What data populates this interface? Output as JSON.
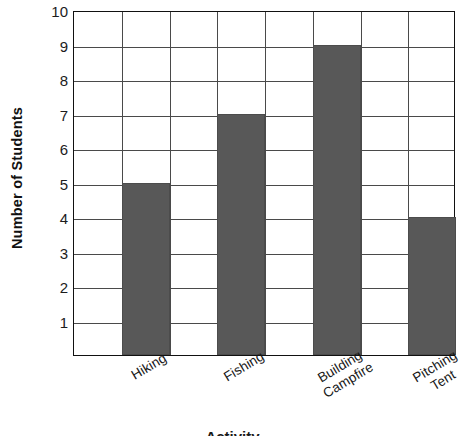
{
  "chart_data": {
    "type": "bar",
    "title": "",
    "xlabel": "Activity",
    "ylabel": "Number of Students",
    "categories": [
      "Hiking",
      "Fishing",
      "Building\nCampfire",
      "Pitching\nTent"
    ],
    "values": [
      5,
      7,
      9,
      4
    ],
    "ylim": [
      0,
      10
    ],
    "ytick_labels": [
      "1",
      "2",
      "3",
      "4",
      "5",
      "6",
      "7",
      "8",
      "9",
      "10"
    ],
    "ytick_values": [
      1,
      2,
      3,
      4,
      5,
      6,
      7,
      8,
      9,
      10
    ],
    "grid": "both",
    "legend": "none",
    "bar_color": "#585858",
    "grid_color": "#4a4a4a",
    "axis_color": "#111111",
    "background": "#ffffff",
    "n_column_slots": 8,
    "bar_slots": [
      1,
      3,
      5,
      7
    ],
    "xtick_rotation_deg": -31
  }
}
